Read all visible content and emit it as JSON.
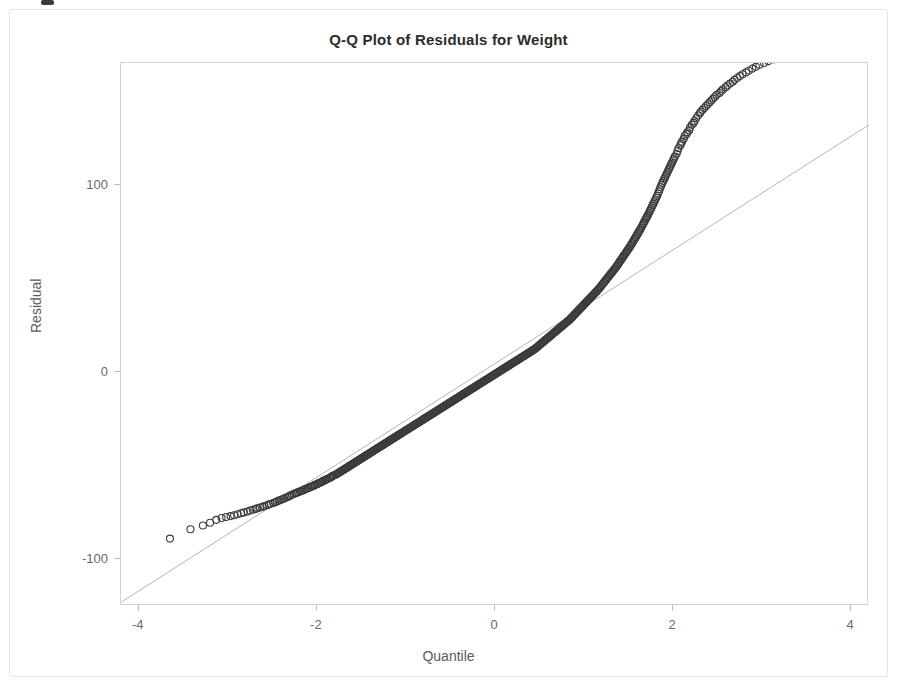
{
  "figure": {
    "title": "Q-Q Plot of Residuals for Weight",
    "x_axis_title": "Quantile",
    "y_axis_title": "Residual",
    "frame_color": "#d3d3d3",
    "marker_color": "#3b3b3b",
    "reference_line_color": "#b5b5b5",
    "background_color": "#ffffff"
  },
  "chart_data": {
    "type": "scatter",
    "title": "Q-Q Plot of Residuals for Weight",
    "xlabel": "Quantile",
    "ylabel": "Residual",
    "xlim": [
      -4.2,
      4.2
    ],
    "ylim": [
      -125,
      165
    ],
    "grid": false,
    "legend": null,
    "xticks": [
      -4,
      -2,
      0,
      2,
      4
    ],
    "xtick_labels": [
      "-4",
      "-2",
      "0",
      "2",
      "4"
    ],
    "yticks": [
      -100,
      0,
      100
    ],
    "ytick_labels": [
      "-100",
      "0",
      "100"
    ],
    "marker_style": "open-circle",
    "marker_size": 7,
    "annotations": [
      "Points curve above the reference line at both tails, indicating a right-skewed, heavy-tailed residual distribution."
    ],
    "reference_line": {
      "name": "normal reference line",
      "x": [
        -4.2,
        4.2
      ],
      "y": [
        -123,
        132
      ],
      "slope": 30.4,
      "intercept": 4.3,
      "style": "thin solid light gray"
    },
    "series": [
      {
        "name": "Residual quantiles",
        "n_points": 601,
        "x": [
          -3.65,
          -3.42,
          -3.28,
          -3.2,
          -3.13,
          -3.07,
          -3.02,
          -2.97,
          -2.93,
          -2.89,
          -2.85,
          -2.82,
          -2.78,
          -2.75,
          -2.72,
          -2.69,
          -2.67,
          -2.64,
          -2.61,
          -2.59,
          -2.56,
          -2.54,
          -2.52,
          -2.49,
          -2.47,
          -2.45,
          -2.43,
          -2.41,
          -2.39,
          -2.37,
          -2.35,
          -2.33,
          -2.31,
          -2.3,
          -2.28,
          -2.26,
          -2.24,
          -2.23,
          -2.21,
          -2.19,
          -2.18,
          -2.16,
          -2.15,
          -2.13,
          -2.12,
          -2.1,
          -2.09,
          -2.07,
          -2.06,
          -2.04,
          -2.03,
          -2.02,
          -2.0,
          -1.99,
          -1.98,
          -1.96,
          -1.95,
          -1.94,
          -1.93,
          -1.91,
          -1.9,
          -1.89,
          -1.88,
          -1.86,
          -1.85,
          -1.84,
          -1.83,
          -1.82,
          -1.81,
          -1.79,
          -1.78,
          -1.77,
          -1.76,
          -1.75,
          -1.74,
          -1.73,
          -1.72,
          -1.71,
          -1.7,
          -1.69,
          -1.68,
          -1.67,
          -1.66,
          -1.65,
          -1.64,
          -1.63,
          -1.62,
          -1.61,
          -1.6,
          -1.59,
          -1.58,
          -1.57,
          -1.56,
          -1.55,
          -1.54,
          -1.53,
          -1.52,
          -1.51,
          -1.5,
          -1.49,
          -1.48,
          -1.47,
          -1.46,
          -1.45,
          -1.44,
          -1.43,
          -1.42,
          -1.41,
          -1.4,
          -1.39,
          -1.38,
          -1.37,
          -1.36,
          -1.35,
          -1.34,
          -1.33,
          -1.32,
          -1.31,
          -1.3,
          -1.29,
          -1.28,
          -1.27,
          -1.26,
          -1.25,
          -1.24,
          -1.23,
          -1.22,
          -1.21,
          -1.2,
          -1.19,
          -1.18,
          -1.17,
          -1.16,
          -1.15,
          -1.14,
          -1.13,
          -1.12,
          -1.11,
          -1.1,
          -1.09,
          -1.08,
          -1.07,
          -1.06,
          -1.05,
          -1.04,
          -1.03,
          -1.02,
          -1.01,
          -1.0,
          -0.99,
          -0.98,
          -0.97,
          -0.96,
          -0.95,
          -0.94,
          -0.93,
          -0.92,
          -0.91,
          -0.9,
          -0.89,
          -0.88,
          -0.87,
          -0.86,
          -0.85,
          -0.84,
          -0.83,
          -0.82,
          -0.81,
          -0.8,
          -0.79,
          -0.78,
          -0.77,
          -0.76,
          -0.75,
          -0.74,
          -0.73,
          -0.72,
          -0.71,
          -0.7,
          -0.69,
          -0.68,
          -0.67,
          -0.66,
          -0.65,
          -0.64,
          -0.63,
          -0.62,
          -0.61,
          -0.6,
          -0.59,
          -0.58,
          -0.57,
          -0.56,
          -0.55,
          -0.54,
          -0.53,
          -0.52,
          -0.51,
          -0.5,
          -0.49,
          -0.48,
          -0.47,
          -0.46,
          -0.45,
          -0.44,
          -0.43,
          -0.42,
          -0.41,
          -0.4,
          -0.39,
          -0.38,
          -0.37,
          -0.36,
          -0.35,
          -0.34,
          -0.33,
          -0.32,
          -0.31,
          -0.3,
          -0.29,
          -0.28,
          -0.27,
          -0.26,
          -0.25,
          -0.24,
          -0.23,
          -0.22,
          -0.21,
          -0.2,
          -0.19,
          -0.18,
          -0.17,
          -0.16,
          -0.15,
          -0.14,
          -0.13,
          -0.12,
          -0.11,
          -0.1,
          -0.09,
          -0.08,
          -0.07,
          -0.06,
          -0.05,
          -0.04,
          -0.03,
          -0.02,
          -0.01,
          0.0,
          0.01,
          0.02,
          0.03,
          0.04,
          0.05,
          0.06,
          0.07,
          0.08,
          0.09,
          0.1,
          0.11,
          0.12,
          0.13,
          0.14,
          0.15,
          0.16,
          0.17,
          0.18,
          0.19,
          0.2,
          0.21,
          0.22,
          0.23,
          0.24,
          0.25,
          0.26,
          0.27,
          0.28,
          0.29,
          0.3,
          0.31,
          0.32,
          0.33,
          0.34,
          0.35,
          0.36,
          0.37,
          0.38,
          0.39,
          0.4,
          0.41,
          0.42,
          0.43,
          0.44,
          0.45,
          0.46,
          0.47,
          0.48,
          0.49,
          0.5,
          0.51,
          0.52,
          0.53,
          0.54,
          0.55,
          0.56,
          0.57,
          0.58,
          0.59,
          0.6,
          0.61,
          0.62,
          0.63,
          0.64,
          0.65,
          0.66,
          0.67,
          0.68,
          0.69,
          0.7,
          0.71,
          0.72,
          0.73,
          0.74,
          0.75,
          0.76,
          0.77,
          0.78,
          0.79,
          0.8,
          0.81,
          0.82,
          0.83,
          0.84,
          0.85,
          0.86,
          0.87,
          0.88,
          0.89,
          0.9,
          0.91,
          0.92,
          0.93,
          0.94,
          0.95,
          0.96,
          0.97,
          0.98,
          0.99,
          1.0,
          1.01,
          1.02,
          1.03,
          1.04,
          1.05,
          1.06,
          1.07,
          1.08,
          1.09,
          1.1,
          1.11,
          1.12,
          1.13,
          1.14,
          1.15,
          1.16,
          1.17,
          1.18,
          1.19,
          1.2,
          1.21,
          1.22,
          1.23,
          1.24,
          1.25,
          1.26,
          1.27,
          1.28,
          1.29,
          1.3,
          1.31,
          1.32,
          1.33,
          1.34,
          1.35,
          1.36,
          1.37,
          1.38,
          1.39,
          1.4,
          1.41,
          1.42,
          1.43,
          1.44,
          1.45,
          1.46,
          1.47,
          1.48,
          1.49,
          1.5,
          1.51,
          1.52,
          1.53,
          1.54,
          1.55,
          1.56,
          1.57,
          1.58,
          1.59,
          1.6,
          1.61,
          1.62,
          1.63,
          1.64,
          1.65,
          1.66,
          1.67,
          1.68,
          1.69,
          1.7,
          1.71,
          1.72,
          1.73,
          1.74,
          1.75,
          1.76,
          1.77,
          1.78,
          1.79,
          1.8,
          1.81,
          1.82,
          1.83,
          1.84,
          1.85,
          1.86,
          1.87,
          1.88,
          1.89,
          1.9,
          1.91,
          1.92,
          1.93,
          1.94,
          1.95,
          1.96,
          1.97,
          1.98,
          1.99,
          2.0,
          2.01,
          2.02,
          2.04,
          2.05,
          2.06,
          2.08,
          2.09,
          2.1,
          2.12,
          2.13,
          2.15,
          2.16,
          2.18,
          2.19,
          2.21,
          2.23,
          2.24,
          2.26,
          2.28,
          2.3,
          2.31,
          2.33,
          2.35,
          2.37,
          2.39,
          2.41,
          2.43,
          2.45,
          2.47,
          2.49,
          2.52,
          2.54,
          2.56,
          2.59,
          2.61,
          2.64,
          2.67,
          2.69,
          2.72,
          2.75,
          2.78,
          2.82,
          2.85,
          2.89,
          2.93,
          2.97,
          3.02,
          3.07,
          3.13,
          3.2,
          3.28,
          3.42,
          3.65
        ],
        "y": [
          -89,
          -84,
          -82,
          -80.5,
          -79,
          -78,
          -77.5,
          -77,
          -76.5,
          -76,
          -75.5,
          -75,
          -74.5,
          -74,
          -73.6,
          -73.2,
          -72.8,
          -72.4,
          -72,
          -71.6,
          -71.2,
          -70.8,
          -70.4,
          -70,
          -69.6,
          -69.2,
          -68.8,
          -68.4,
          -68,
          -67.6,
          -67.2,
          -66.8,
          -66.4,
          -66,
          -65.6,
          -65.2,
          -64.8,
          -64.5,
          -64.2,
          -63.9,
          -63.6,
          -63.3,
          -63,
          -62.7,
          -62.4,
          -62.1,
          -61.8,
          -61.5,
          -61.2,
          -60.9,
          -60.6,
          -60.3,
          -60,
          -59.7,
          -59.4,
          -59.1,
          -58.8,
          -58.5,
          -58.2,
          -57.9,
          -57.6,
          -57.3,
          -57,
          -56.7,
          -56.4,
          -56.1,
          -55.8,
          -55.5,
          -55.2,
          -54.9,
          -54.6,
          -54.3,
          -54,
          -53.7,
          -53.4,
          -53.1,
          -52.8,
          -52.5,
          -52.2,
          -51.9,
          -51.6,
          -51.3,
          -51,
          -50.7,
          -50.4,
          -50.1,
          -49.8,
          -49.5,
          -49.2,
          -48.9,
          -48.6,
          -48.3,
          -48,
          -47.7,
          -47.4,
          -47.1,
          -46.8,
          -46.5,
          -46.2,
          -45.9,
          -45.6,
          -45.3,
          -45,
          -44.7,
          -44.4,
          -44.1,
          -43.8,
          -43.5,
          -43.2,
          -42.9,
          -42.6,
          -42.3,
          -42,
          -41.7,
          -41.4,
          -41.1,
          -40.8,
          -40.5,
          -40.2,
          -39.9,
          -39.6,
          -39.3,
          -39,
          -38.7,
          -38.4,
          -38.1,
          -37.8,
          -37.5,
          -37.2,
          -36.9,
          -36.6,
          -36.3,
          -36,
          -35.7,
          -35.4,
          -35.1,
          -34.8,
          -34.5,
          -34.2,
          -33.9,
          -33.6,
          -33.3,
          -33,
          -32.7,
          -32.4,
          -32.1,
          -31.8,
          -31.5,
          -31.2,
          -30.9,
          -30.6,
          -30.3,
          -30,
          -29.7,
          -29.4,
          -29.1,
          -28.8,
          -28.5,
          -28.2,
          -27.9,
          -27.6,
          -27.3,
          -27,
          -26.7,
          -26.4,
          -26.1,
          -25.8,
          -25.5,
          -25.2,
          -24.9,
          -24.6,
          -24.3,
          -24,
          -23.7,
          -23.4,
          -23.1,
          -22.8,
          -22.5,
          -22.2,
          -21.9,
          -21.6,
          -21.3,
          -21,
          -20.7,
          -20.4,
          -20.1,
          -19.8,
          -19.5,
          -19.2,
          -18.9,
          -18.6,
          -18.3,
          -18,
          -17.7,
          -17.4,
          -17.1,
          -16.8,
          -16.5,
          -16.2,
          -15.9,
          -15.6,
          -15.3,
          -15,
          -14.7,
          -14.4,
          -14.1,
          -13.8,
          -13.5,
          -13.2,
          -12.9,
          -12.6,
          -12.3,
          -12,
          -11.7,
          -11.4,
          -11.1,
          -10.8,
          -10.5,
          -10.2,
          -9.9,
          -9.6,
          -9.3,
          -9,
          -8.7,
          -8.4,
          -8.1,
          -7.8,
          -7.5,
          -7.2,
          -6.9,
          -6.6,
          -6.3,
          -6,
          -5.7,
          -5.4,
          -5.1,
          -4.8,
          -4.5,
          -4.2,
          -3.9,
          -3.6,
          -3.3,
          -3,
          -2.7,
          -2.4,
          -2.1,
          -1.8,
          -1.5,
          -1.2,
          -0.9,
          -0.6,
          -0.3,
          0,
          0.3,
          0.6,
          0.9,
          1.2,
          1.5,
          1.8,
          2.1,
          2.4,
          2.7,
          3,
          3.3,
          3.6,
          3.9,
          4.2,
          4.5,
          4.8,
          5.1,
          5.4,
          5.7,
          6,
          6.3,
          6.6,
          6.9,
          7.2,
          7.5,
          7.8,
          8.1,
          8.4,
          8.7,
          9,
          9.3,
          9.6,
          9.9,
          10.2,
          10.5,
          10.8,
          11.1,
          11.4,
          11.7,
          12,
          12.4,
          12.8,
          13.2,
          13.6,
          14,
          14.4,
          14.8,
          15.2,
          15.6,
          16,
          16.4,
          16.8,
          17.2,
          17.6,
          18,
          18.4,
          18.8,
          19.2,
          19.6,
          20,
          20.4,
          20.8,
          21.2,
          21.6,
          22,
          22.4,
          22.8,
          23.2,
          23.6,
          24,
          24.4,
          24.8,
          25.2,
          25.6,
          26,
          26.4,
          26.8,
          27.2,
          27.6,
          28,
          28.5,
          29,
          29.5,
          30,
          30.5,
          31,
          31.5,
          32,
          32.5,
          33,
          33.5,
          34,
          34.5,
          35,
          35.5,
          36,
          36.5,
          37,
          37.5,
          38,
          38.5,
          39,
          39.5,
          40,
          40.5,
          41,
          41.5,
          42,
          42.5,
          43,
          43.5,
          44,
          44.6,
          45.2,
          45.8,
          46.4,
          47,
          47.6,
          48.2,
          48.8,
          49.4,
          50,
          50.6,
          51.2,
          51.8,
          52.4,
          53,
          53.6,
          54.2,
          54.8,
          55.4,
          56,
          56.7,
          57.4,
          58.1,
          58.8,
          59.5,
          60.2,
          60.9,
          61.6,
          62.3,
          63,
          63.7,
          64.4,
          65.1,
          65.8,
          66.5,
          67.2,
          68,
          68.8,
          69.6,
          70.4,
          71.2,
          72,
          72.8,
          73.6,
          74.4,
          75.2,
          76,
          76.9,
          77.8,
          78.7,
          79.6,
          80.5,
          81.4,
          82.3,
          83.2,
          84.1,
          85,
          86,
          87,
          88,
          89,
          90,
          91,
          92,
          93,
          94,
          95.2,
          96.4,
          97.6,
          98.8,
          100,
          101,
          102,
          103,
          104,
          105,
          106,
          107,
          108,
          109,
          110,
          111,
          112,
          113,
          114,
          115,
          116.5,
          118,
          119.5,
          121,
          122,
          123,
          124.5,
          126,
          127,
          128,
          129,
          130.5,
          132,
          133,
          134,
          135.5,
          137,
          138,
          139,
          140,
          141,
          142,
          143,
          144,
          145,
          146,
          147,
          148,
          149,
          150,
          151,
          152,
          153,
          154,
          155,
          156,
          157,
          158,
          159,
          160,
          161,
          162,
          163,
          164,
          165,
          166,
          167,
          168,
          169,
          170,
          171
        ]
      }
    ]
  }
}
